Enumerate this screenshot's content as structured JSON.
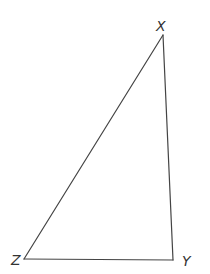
{
  "diagram": {
    "type": "triangle",
    "stroke_color": "#444444",
    "label_color": "#333333",
    "vertices": {
      "X": {
        "label": "X",
        "x": 163,
        "y": 35
      },
      "Y": {
        "label": "Y",
        "x": 173,
        "y": 260
      },
      "Z": {
        "label": "Z",
        "x": 24,
        "y": 259
      }
    },
    "edges": [
      {
        "from": "X",
        "to": "Y",
        "name": "XY"
      },
      {
        "from": "Y",
        "to": "Z",
        "name": "YZ"
      },
      {
        "from": "Z",
        "to": "X",
        "name": "ZX"
      }
    ]
  }
}
